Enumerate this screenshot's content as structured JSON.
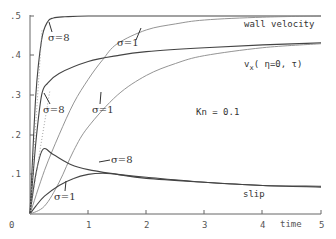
{
  "chart_data": {
    "type": "line",
    "title": "",
    "xlabel": "time",
    "ylabel": "",
    "xlim": [
      0,
      5
    ],
    "ylim": [
      0,
      0.5
    ],
    "x_ticks": [
      "0",
      "1",
      "2",
      "3",
      "4",
      "5"
    ],
    "y_ticks": [
      ".1",
      ".2",
      ".3",
      ".4",
      ".5"
    ],
    "origin_label": "0",
    "grid": false,
    "annotations": {
      "kn": "Kn = 0.1",
      "wall_velocity": "wall velocity",
      "vx": "v",
      "vx_sub": "x",
      "vx_args": "( η=0, τ)",
      "slip": "slip",
      "sigma8_wall": "σ=8",
      "sigma1_wall": "σ=1",
      "sigma8_vx": "σ=8",
      "sigma1_vx": "σ=1",
      "sigma8_slip": "σ=8",
      "sigma1_slip": "σ=1"
    },
    "series": [
      {
        "name": "wall velocity σ=8",
        "x": [
          0,
          0.1,
          0.2,
          0.3,
          0.4,
          0.6,
          1,
          2,
          3,
          4,
          5
        ],
        "values": [
          0,
          0.3,
          0.44,
          0.485,
          0.495,
          0.498,
          0.5,
          0.5,
          0.5,
          0.5,
          0.5
        ]
      },
      {
        "name": "wall velocity σ=1",
        "x": [
          0,
          0.25,
          0.5,
          0.75,
          1,
          1.25,
          1.5,
          2,
          2.5,
          3,
          4,
          5
        ],
        "values": [
          0,
          0.11,
          0.2,
          0.28,
          0.34,
          0.39,
          0.43,
          0.465,
          0.48,
          0.49,
          0.497,
          0.5
        ]
      },
      {
        "name": "v_x(η=0,τ) σ=8",
        "x": [
          0,
          0.1,
          0.2,
          0.3,
          0.5,
          1,
          1.5,
          2,
          3,
          4,
          5
        ],
        "values": [
          0,
          0.18,
          0.3,
          0.33,
          0.355,
          0.385,
          0.4,
          0.41,
          0.42,
          0.427,
          0.432
        ]
      },
      {
        "name": "v_x(η=0,τ) σ=1",
        "x": [
          0,
          0.25,
          0.5,
          0.75,
          1,
          1.5,
          2,
          2.5,
          3,
          4,
          5
        ],
        "values": [
          0,
          0.02,
          0.08,
          0.16,
          0.22,
          0.3,
          0.35,
          0.38,
          0.4,
          0.42,
          0.43
        ]
      },
      {
        "name": "slip σ=8",
        "x": [
          0,
          0.1,
          0.22,
          0.4,
          0.7,
          1,
          1.5,
          2,
          3,
          4,
          5
        ],
        "values": [
          0,
          0.1,
          0.163,
          0.15,
          0.125,
          0.112,
          0.1,
          0.09,
          0.08,
          0.072,
          0.07
        ]
      },
      {
        "name": "slip σ=1",
        "x": [
          0,
          0.1,
          0.25,
          0.5,
          0.75,
          1,
          1.25,
          1.5,
          2,
          3,
          4,
          5
        ],
        "values": [
          0,
          0.02,
          0.045,
          0.072,
          0.09,
          0.1,
          0.103,
          0.1,
          0.093,
          0.08,
          0.072,
          0.068
        ]
      }
    ]
  }
}
